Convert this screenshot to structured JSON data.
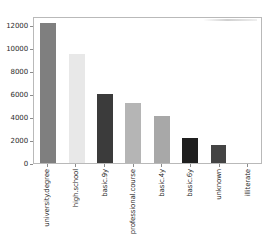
{
  "chart_data": {
    "type": "bar",
    "title": "",
    "xlabel": "",
    "ylabel": "",
    "categories": [
      "university.degree",
      "high.school",
      "basic.9y",
      "professional.course",
      "basic.4y",
      "basic.6y",
      "unknown",
      "illiterate"
    ],
    "values": [
      12200,
      9500,
      6000,
      5200,
      4100,
      2200,
      1600,
      0
    ],
    "bar_colors": [
      "#7f7f7f",
      "#e8e8e8",
      "#3b3b3b",
      "#b5b5b5",
      "#a8a8a8",
      "#1f1f1f",
      "#444444",
      "#ffffff"
    ],
    "ylim": [
      0,
      12800
    ],
    "yticks": [
      0,
      2000,
      4000,
      6000,
      8000,
      10000,
      12000
    ],
    "ytick_labels": [
      "0",
      "2000",
      "4000",
      "6000",
      "8000",
      "10000",
      "12000"
    ],
    "grid": false,
    "legend": null,
    "frame": true,
    "xtick_rotation": -90
  },
  "axes": {
    "y_axis_name": "y-axis",
    "x_axis_name": "x-axis"
  }
}
